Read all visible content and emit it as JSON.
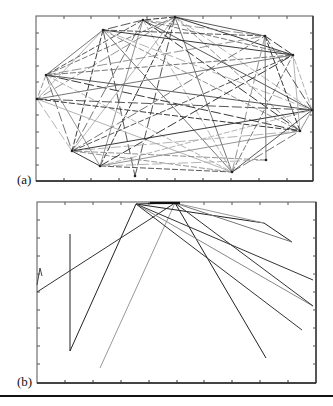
{
  "chart_data": [
    {
      "type": "network",
      "panel_label": "(a)",
      "title": "",
      "xlabel": "",
      "ylabel": "",
      "grid": false,
      "box": {
        "x": 36,
        "y": 16,
        "w": 277,
        "h": 165
      },
      "x_ticks_px": [
        64,
        91,
        119,
        147,
        175,
        203,
        231,
        259,
        287
      ],
      "y_ticks_px": [
        33,
        49,
        66,
        82,
        99,
        115,
        132,
        148,
        165
      ],
      "nodes": [
        [
          175,
          17
        ],
        [
          143,
          20
        ],
        [
          103,
          30
        ],
        [
          46,
          75
        ],
        [
          37,
          99
        ],
        [
          72,
          151
        ],
        [
          100,
          166
        ],
        [
          135,
          176
        ],
        [
          232,
          172
        ],
        [
          300,
          131
        ],
        [
          312,
          110
        ],
        [
          293,
          55
        ],
        [
          265,
          36
        ],
        [
          266,
          160
        ]
      ],
      "edges": [
        [
          0,
          1
        ],
        [
          1,
          2
        ],
        [
          2,
          3
        ],
        [
          3,
          4
        ],
        [
          4,
          5
        ],
        [
          5,
          6
        ],
        [
          6,
          8
        ],
        [
          8,
          9
        ],
        [
          9,
          10
        ],
        [
          10,
          11
        ],
        [
          11,
          12
        ],
        [
          12,
          0
        ],
        [
          0,
          3
        ],
        [
          0,
          4
        ],
        [
          0,
          5
        ],
        [
          0,
          6
        ],
        [
          0,
          7
        ],
        [
          0,
          8
        ],
        [
          0,
          9
        ],
        [
          0,
          10
        ],
        [
          0,
          11
        ],
        [
          1,
          3
        ],
        [
          1,
          5
        ],
        [
          1,
          6
        ],
        [
          1,
          8
        ],
        [
          1,
          9
        ],
        [
          1,
          10
        ],
        [
          1,
          11
        ],
        [
          1,
          12
        ],
        [
          2,
          4
        ],
        [
          2,
          5
        ],
        [
          2,
          7
        ],
        [
          2,
          8
        ],
        [
          2,
          9
        ],
        [
          2,
          10
        ],
        [
          2,
          11
        ],
        [
          2,
          12
        ],
        [
          3,
          5
        ],
        [
          3,
          6
        ],
        [
          3,
          8
        ],
        [
          3,
          9
        ],
        [
          3,
          10
        ],
        [
          3,
          11
        ],
        [
          3,
          12
        ],
        [
          4,
          8
        ],
        [
          4,
          9
        ],
        [
          4,
          10
        ],
        [
          4,
          11
        ],
        [
          5,
          8
        ],
        [
          5,
          9
        ],
        [
          5,
          10
        ],
        [
          5,
          11
        ],
        [
          5,
          12
        ],
        [
          6,
          9
        ],
        [
          6,
          10
        ],
        [
          6,
          11
        ],
        [
          8,
          10
        ],
        [
          8,
          11
        ],
        [
          8,
          12
        ],
        [
          9,
          11
        ],
        [
          9,
          12
        ],
        [
          10,
          12
        ],
        [
          12,
          13
        ],
        [
          13,
          5
        ],
        [
          13,
          6
        ]
      ]
    },
    {
      "type": "network",
      "panel_label": "(b)",
      "title": "",
      "xlabel": "",
      "ylabel": "",
      "grid": false,
      "box": {
        "x": 37,
        "y": 202,
        "w": 279,
        "h": 181
      },
      "x_ticks_px": [
        65,
        93,
        121,
        149,
        177,
        204,
        232,
        260,
        288
      ],
      "y_ticks_px": [
        220,
        238,
        256,
        274,
        292,
        310,
        328,
        346,
        364
      ],
      "paths": [
        {
          "pts": [
            [
              70,
              351
            ],
            [
              136,
              204
            ],
            [
              175,
              203
            ]
          ],
          "shade": "#222"
        },
        {
          "pts": [
            [
              37,
              292
            ],
            [
              175,
              203
            ]
          ],
          "shade": "#333"
        },
        {
          "pts": [
            [
              70,
              234
            ],
            [
              70,
              351
            ]
          ],
          "shade": "#222"
        },
        {
          "pts": [
            [
              37,
              285
            ],
            [
              40,
              268
            ],
            [
              42,
              276
            ]
          ],
          "shade": "#444"
        },
        {
          "pts": [
            [
              100,
              368
            ],
            [
              175,
              203
            ]
          ],
          "shade": "#999"
        },
        {
          "pts": [
            [
              175,
              203
            ],
            [
              266,
              358
            ]
          ],
          "shade": "#222"
        },
        {
          "pts": [
            [
              136,
              204
            ],
            [
              264,
              223
            ],
            [
              292,
              242
            ]
          ],
          "shade": "#222"
        },
        {
          "pts": [
            [
              136,
              204
            ],
            [
              313,
              280
            ]
          ],
          "shade": "#333"
        },
        {
          "pts": [
            [
              136,
              204
            ],
            [
              313,
              306
            ]
          ],
          "shade": "#888"
        },
        {
          "pts": [
            [
              136,
              204
            ],
            [
              302,
              330
            ]
          ],
          "shade": "#333"
        },
        {
          "pts": [
            [
              175,
              203
            ],
            [
              313,
              306
            ]
          ],
          "shade": "#333"
        },
        {
          "pts": [
            [
              175,
              203
            ],
            [
              292,
              242
            ]
          ],
          "shade": "#777"
        },
        {
          "pts": [
            [
              175,
              203
            ],
            [
              264,
              223
            ]
          ],
          "shade": "#999"
        }
      ]
    }
  ],
  "figure": {
    "label_a": "(a)",
    "label_b": "(b)"
  }
}
